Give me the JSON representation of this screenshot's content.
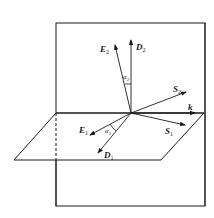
{
  "diagram": {
    "type": "interface-vectors",
    "stroke_color": "#1a1a1a",
    "background": "#ffffff",
    "planes": {
      "vertical": {
        "name": "vertical plane",
        "x1": 56,
        "y1": 23,
        "x2": 205,
        "y2": 206
      },
      "horizontal": {
        "name": "interface plane",
        "points": "56,113 204,113 161,160 14,160"
      }
    },
    "origin": {
      "x": 131,
      "y": 113
    },
    "vectors": [
      {
        "id": "E2",
        "main": "E",
        "sub": "2",
        "tip": [
          115,
          45
        ],
        "label_pos": [
          100,
          52
        ]
      },
      {
        "id": "D2",
        "main": "D",
        "sub": "2",
        "tip": [
          131,
          40
        ],
        "label_pos": [
          136,
          50
        ]
      },
      {
        "id": "S2",
        "main": "S",
        "sub": "2",
        "tip": [
          186,
          92
        ],
        "label_pos": [
          173,
          92
        ]
      },
      {
        "id": "k",
        "main": "k",
        "sub": "",
        "tip": [
          195,
          113
        ],
        "label_pos": [
          188,
          110
        ]
      },
      {
        "id": "S1",
        "main": "S",
        "sub": "1",
        "tip": [
          185,
          125
        ],
        "label_pos": [
          165,
          134
        ]
      },
      {
        "id": "E1",
        "main": "E",
        "sub": "1",
        "tip": [
          90,
          135
        ],
        "label_pos": [
          79,
          133
        ]
      },
      {
        "id": "D1",
        "main": "D",
        "sub": "1",
        "tip": [
          98,
          153
        ],
        "label_pos": [
          104,
          158
        ]
      }
    ],
    "angles": [
      {
        "id": "alpha2",
        "symbol": "α",
        "sub": "2",
        "label_pos": [
          123,
          77
        ]
      },
      {
        "id": "alpha1",
        "symbol": "α",
        "sub": "1",
        "label_pos": [
          105,
          133
        ]
      }
    ]
  }
}
